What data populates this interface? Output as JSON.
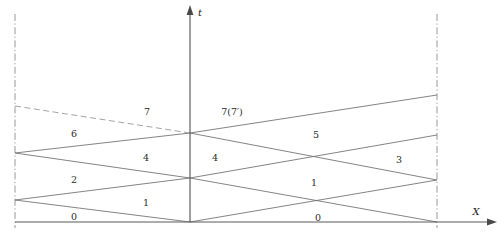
{
  "figure": {
    "background_color": "#ffffff",
    "line_color": "#6b6b6b",
    "axis_color": "#4a4a4a",
    "label_color": "#2b2b2b",
    "width": 504,
    "height": 237
  },
  "axes": {
    "t_axis": {
      "name": "t",
      "label": "t",
      "x": 190,
      "y_top": 6,
      "y_bottom": 222,
      "label_x": 200,
      "label_y": 13
    },
    "x_axis": {
      "name": "X",
      "label": "X",
      "y": 222,
      "x_left": 15,
      "x_right": 497,
      "label_x": 476,
      "label_y": 212
    }
  },
  "boundaries": [
    {
      "name": "left-boundary",
      "x": 15,
      "y_top": 14,
      "y_bottom": 228,
      "style": "dash-dot"
    },
    {
      "name": "right-boundary",
      "x": 437,
      "y_top": 14,
      "y_bottom": 228,
      "style": "dash-dot"
    }
  ],
  "characteristics": [
    {
      "name": "char-0-right",
      "x1": 15,
      "y1": 200,
      "x2": 190,
      "y2": 222,
      "style": "solid"
    },
    {
      "name": "char-0-left-continued",
      "x1": 190,
      "y1": 222,
      "x2": 437,
      "y2": 180,
      "style": "solid"
    },
    {
      "name": "char-1-up",
      "x1": 15,
      "y1": 200,
      "x2": 190,
      "y2": 178,
      "style": "solid"
    },
    {
      "name": "char-1-right-lower",
      "x1": 190,
      "y1": 178,
      "x2": 437,
      "y2": 222,
      "style": "solid"
    },
    {
      "name": "char-2-up",
      "x1": 15,
      "y1": 153,
      "x2": 190,
      "y2": 178,
      "style": "solid"
    },
    {
      "name": "char-4-up",
      "x1": 15,
      "y1": 153,
      "x2": 190,
      "y2": 133,
      "style": "solid"
    },
    {
      "name": "char-4-right",
      "x1": 190,
      "y1": 133,
      "x2": 437,
      "y2": 180,
      "style": "solid"
    },
    {
      "name": "char-5-up-right",
      "x1": 190,
      "y1": 178,
      "x2": 437,
      "y2": 135,
      "style": "solid"
    },
    {
      "name": "char-6-upper",
      "x1": 15,
      "y1": 106,
      "x2": 190,
      "y2": 133,
      "style": "dashed"
    },
    {
      "name": "char-7-right",
      "x1": 190,
      "y1": 133,
      "x2": 437,
      "y2": 95,
      "style": "solid"
    },
    {
      "name": "char-7-down-right",
      "x1": 437,
      "y1": 95,
      "x2": 190,
      "y2": 133,
      "style": "none"
    }
  ],
  "region_labels": [
    {
      "name": "region-7-left",
      "text": "7",
      "x": 147,
      "y": 112
    },
    {
      "name": "region-7-7prime",
      "text": "7(7′)",
      "x": 232,
      "y": 112
    },
    {
      "name": "region-6",
      "text": "6",
      "x": 74,
      "y": 134
    },
    {
      "name": "region-5",
      "text": "5",
      "x": 316,
      "y": 135
    },
    {
      "name": "region-4-left",
      "text": "4",
      "x": 146,
      "y": 158
    },
    {
      "name": "region-4-right",
      "text": "4",
      "x": 215,
      "y": 158
    },
    {
      "name": "region-3",
      "text": "3",
      "x": 399,
      "y": 160
    },
    {
      "name": "region-2",
      "text": "2",
      "x": 74,
      "y": 180
    },
    {
      "name": "region-1-left",
      "text": "1",
      "x": 146,
      "y": 203
    },
    {
      "name": "region-1-right",
      "text": "1",
      "x": 314,
      "y": 183
    },
    {
      "name": "region-0-left",
      "text": "0",
      "x": 74,
      "y": 217
    },
    {
      "name": "region-0-right",
      "text": "0",
      "x": 318,
      "y": 218
    }
  ]
}
